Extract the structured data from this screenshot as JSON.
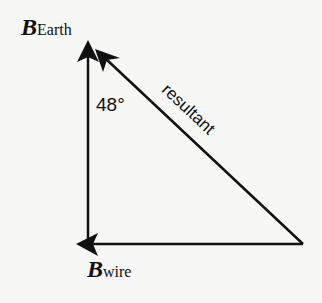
{
  "diagram": {
    "labels": {
      "b_earth": {
        "symbol": "B",
        "subscript": "Earth"
      },
      "b_wire": {
        "symbol": "B",
        "subscript": "wire"
      },
      "angle": "48°",
      "resultant": "resultant"
    },
    "vectors": [
      {
        "name": "B_Earth",
        "from": [
          88,
          244
        ],
        "to": [
          88,
          42
        ],
        "direction": "up"
      },
      {
        "name": "B_wire",
        "from": [
          303,
          244
        ],
        "to": [
          77,
          244
        ],
        "direction": "left"
      },
      {
        "name": "resultant",
        "from": [
          303,
          244
        ],
        "to": [
          96,
          50
        ],
        "direction": "up-left"
      }
    ],
    "colors": {
      "line": "#111111",
      "background": "#f7f7f5"
    }
  }
}
